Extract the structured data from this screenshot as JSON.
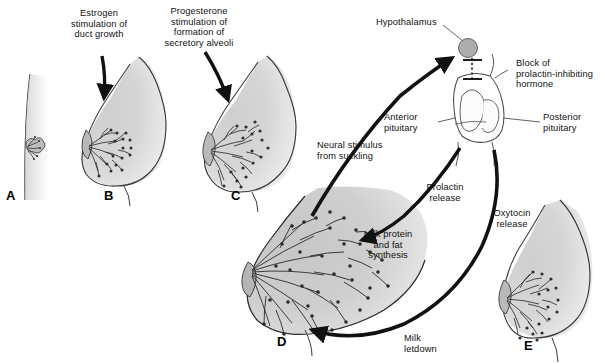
{
  "figure": {
    "title_semantic": "breast-development-and-lactation-diagram",
    "background_color": "#ffffff",
    "ink_color": "#1a1a1a",
    "fill_light": "#d9d9d9",
    "fill_mid": "#c9c9c9",
    "fill_dark": "#b3b3b3",
    "duct_color": "#3a3a3a"
  },
  "panels": [
    {
      "letter": "A",
      "name": "prepubertal-breast",
      "x": 6,
      "y": 188
    },
    {
      "letter": "B",
      "name": "estrogen-duct-growth-breast",
      "x": 104,
      "y": 188
    },
    {
      "letter": "C",
      "name": "progesterone-alveoli-breast",
      "x": 231,
      "y": 188
    },
    {
      "letter": "D",
      "name": "lactating-breast",
      "x": 277,
      "y": 334
    },
    {
      "letter": "E",
      "name": "post-letdown-breast",
      "x": 524,
      "y": 338
    }
  ],
  "labels": {
    "estrogen": "Estrogen\nstimulation of\nduct growth",
    "progesterone": "Progesterone\nstimulation of\nformation of\nsecretory alveoli",
    "hypothalamus": "Hypothalamus",
    "block_prolactin": "Block of\nprolactin-inhibiting\nhormone",
    "anterior_pituitary": "Anterior\npituitary",
    "posterior_pituitary": "Posterior\npituitary",
    "neural_stimulus": "Neural stimulus\nfrom suckling",
    "prolactin_release": "Prolactin\nrelease",
    "oxytocin_release": "Oxytocin\nrelease",
    "milk_protein": "Milk protein\nand fat\nsynthesis",
    "milk_letdown": "Milk\nletdown"
  },
  "flow": {
    "type": "physiological-pathway",
    "steps": [
      {
        "from": "suckling",
        "to": "hypothalamus",
        "label": "Neural stimulus from suckling"
      },
      {
        "from": "hypothalamus",
        "to": "anterior-pituitary",
        "label": "Block of prolactin-inhibiting hormone"
      },
      {
        "from": "anterior-pituitary",
        "to": "breast-alveoli",
        "label": "Prolactin release"
      },
      {
        "from": "breast-alveoli",
        "to": "milk",
        "label": "Milk protein and fat synthesis"
      },
      {
        "from": "posterior-pituitary",
        "to": "breast-myoepithelium",
        "label": "Oxytocin release"
      },
      {
        "from": "breast-myoepithelium",
        "to": "nipple",
        "label": "Milk letdown"
      }
    ]
  }
}
